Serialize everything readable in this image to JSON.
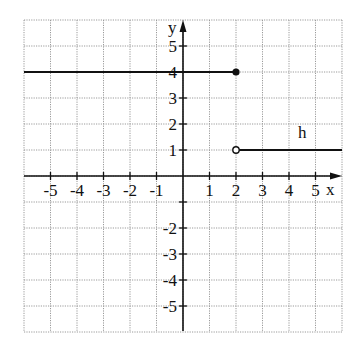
{
  "page": {
    "cropped_heading_fragment": "...."
  },
  "chart_data": {
    "type": "line",
    "title": "",
    "function_label": "h",
    "xlabel": "x",
    "ylabel": "y",
    "xlim": [
      -6,
      6
    ],
    "ylim": [
      -6,
      6
    ],
    "grid": true,
    "x_ticks": [
      -5,
      -4,
      -3,
      -2,
      -1,
      1,
      2,
      3,
      4,
      5
    ],
    "x_tick_labels": [
      "-5",
      "-4",
      "-3",
      "-2",
      "-1",
      "1",
      "2",
      "3",
      "4",
      "5"
    ],
    "y_ticks": [
      5,
      4,
      3,
      2,
      1,
      -1,
      -2,
      -3,
      -4,
      -5
    ],
    "y_tick_labels": [
      "5",
      "4",
      "3",
      "2",
      "1",
      "",
      "-2",
      "-3",
      "-4",
      "-5"
    ],
    "series": [
      {
        "name": "h (piece 1)",
        "segments": [
          {
            "x1": -6,
            "y1": 4,
            "x2": 2,
            "y2": 4
          }
        ],
        "endpoint": {
          "x": 2,
          "y": 4,
          "marker": "closed"
        }
      },
      {
        "name": "h (piece 2)",
        "segments": [
          {
            "x1": 2,
            "y1": 1,
            "x2": 6,
            "y2": 1
          }
        ],
        "endpoint": {
          "x": 2,
          "y": 1,
          "marker": "open"
        }
      }
    ],
    "annotations": [
      {
        "text": "h",
        "x": 4.5,
        "y": 1.45
      }
    ],
    "colors": {
      "grid": "#9a9a9a",
      "axes": "#111111",
      "line": "#111111"
    }
  }
}
